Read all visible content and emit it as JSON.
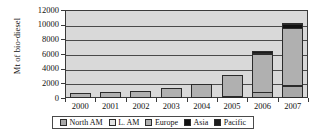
{
  "chart_data": {
    "type": "bar",
    "stacked": true,
    "title": "",
    "xlabel": "",
    "ylabel": "Mt of bio-diesel",
    "categories": [
      "2000",
      "2001",
      "2002",
      "2003",
      "2004",
      "2005",
      "2006",
      "2007"
    ],
    "ylim": [
      0,
      12000
    ],
    "yticks": [
      0,
      2000,
      4000,
      6000,
      8000,
      10000,
      12000
    ],
    "ytick_labels": [
      "0",
      "2000",
      "4000",
      "6000",
      "8000",
      "10000",
      "12000"
    ],
    "grid": true,
    "legend_position": "bottom",
    "series": [
      {
        "name": "North AM",
        "color": "#a8a8a8",
        "values": [
          0,
          0,
          0,
          0,
          0,
          250,
          800,
          1600
        ]
      },
      {
        "name": "L. AM",
        "color": "#e2e2e2",
        "values": [
          0,
          0,
          0,
          0,
          0,
          0,
          0,
          100
        ]
      },
      {
        "name": "Europe",
        "color": "#b0b0b0",
        "values": [
          700,
          780,
          1000,
          1300,
          1850,
          2850,
          5200,
          7800
        ]
      },
      {
        "name": "Asia",
        "color": "#111111",
        "values": [
          0,
          0,
          0,
          0,
          0,
          0,
          180,
          450
        ]
      },
      {
        "name": "Pacific",
        "color": "#1c1c1c",
        "values": [
          0,
          0,
          0,
          0,
          0,
          0,
          20,
          50
        ]
      }
    ],
    "totals": [
      700,
      780,
      1000,
      1300,
      1850,
      3100,
      6200,
      10000
    ]
  },
  "legend": {
    "items": [
      {
        "label": "North AM",
        "color": "#a8a8a8"
      },
      {
        "label": "L. AM",
        "color": "#e2e2e2"
      },
      {
        "label": "Europe",
        "color": "#b0b0b0"
      },
      {
        "label": "Asia",
        "color": "#111111"
      },
      {
        "label": "Pacific",
        "color": "#1c1c1c"
      }
    ]
  },
  "colors": {
    "plot_background": "#d9d9d9",
    "gridline": "#4a4a4a",
    "axis": "#3a3a3a",
    "text": "#111111"
  }
}
